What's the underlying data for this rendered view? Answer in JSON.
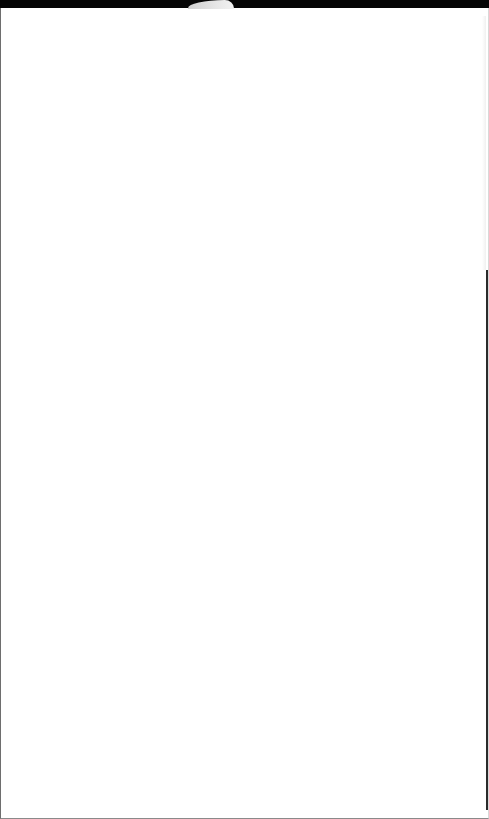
{
  "window": {
    "title": "",
    "background_color": "#ffffff",
    "top_bar_color": "#050505",
    "tab_color": "#e6e6e6",
    "border_color": "#6e6e6e"
  },
  "content": {
    "text": ""
  }
}
